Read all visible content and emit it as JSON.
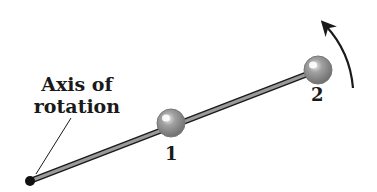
{
  "diagram": {
    "axis_label_line1": "Axis of",
    "axis_label_line2": "rotation",
    "mass_1_label": "1",
    "mass_2_label": "2",
    "colors": {
      "rod": "#8c8c8c",
      "rod_outline": "#1a1a1a",
      "ball": "#8a8a8a",
      "pivot": "#111111",
      "text": "#1a1a1a"
    }
  }
}
